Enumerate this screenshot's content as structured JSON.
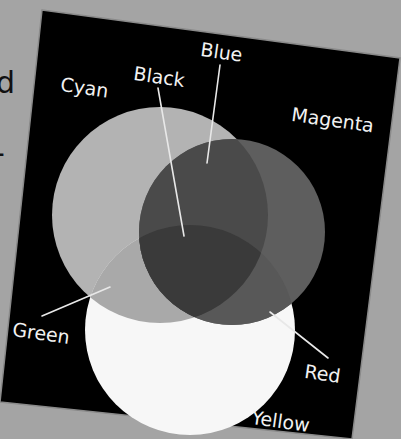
{
  "background": {
    "color": "#a4a4a4",
    "fragments": [
      "d",
      "-"
    ]
  },
  "board": {
    "color": "#000000",
    "corners": [
      [
        42,
        10
      ],
      [
        400,
        58
      ],
      [
        352,
        439
      ],
      [
        0,
        402
      ]
    ]
  },
  "diagram": {
    "circles": [
      {
        "name": "cyan",
        "cx": 160,
        "cy": 215,
        "r": 108,
        "fill": "#b3b3b3"
      },
      {
        "name": "magenta",
        "cx": 232,
        "cy": 232,
        "r": 93,
        "fill": "#5e5e5e"
      },
      {
        "name": "yellow",
        "cx": 190,
        "cy": 330,
        "r": 105,
        "fill": "#f7f7f7"
      }
    ],
    "overlap_colors": {
      "blue": "#4a4a4a",
      "green": "#a9a9a9",
      "red": "#585858",
      "black": "#3a3a3a"
    },
    "labels": [
      {
        "key": "cyan",
        "text": "Cyan",
        "x": 62,
        "y": 75,
        "rot": 8
      },
      {
        "key": "black",
        "text": "Black",
        "x": 135,
        "y": 64,
        "rot": 8
      },
      {
        "key": "blue",
        "text": "Blue",
        "x": 202,
        "y": 40,
        "rot": 8
      },
      {
        "key": "magenta",
        "text": "Magenta",
        "x": 293,
        "y": 105,
        "rot": 8
      },
      {
        "key": "green",
        "text": "Green",
        "x": 14,
        "y": 320,
        "rot": 8
      },
      {
        "key": "red",
        "text": "Red",
        "x": 306,
        "y": 362,
        "rot": 8
      },
      {
        "key": "yellow",
        "text": "Yellow",
        "x": 253,
        "y": 408,
        "rot": 8
      }
    ],
    "leader_lines": [
      {
        "key": "black",
        "x1": 158,
        "y1": 88,
        "x2": 184,
        "y2": 236
      },
      {
        "key": "blue",
        "x1": 220,
        "y1": 65,
        "x2": 207,
        "y2": 163
      },
      {
        "key": "green",
        "x1": 42,
        "y1": 316,
        "x2": 110,
        "y2": 287
      },
      {
        "key": "red",
        "x1": 270,
        "y1": 312,
        "x2": 328,
        "y2": 358
      }
    ]
  }
}
